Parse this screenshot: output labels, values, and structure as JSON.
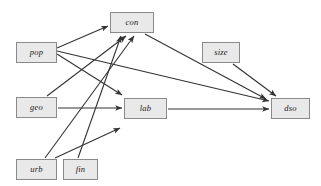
{
  "diagram": {
    "type": "directed-graph",
    "title": "",
    "canvas": {
      "width": 321,
      "height": 186,
      "background": "#ffffff"
    },
    "style": {
      "node_fill": "#e9e9e9",
      "node_border": "#8a8a8a",
      "edge_color": "#333333",
      "label_color": "#1a1a1a"
    },
    "nodes": [
      {
        "id": "con",
        "label": "con",
        "x": 110,
        "y": 12,
        "w": 44,
        "h": 21
      },
      {
        "id": "pop",
        "label": "pop",
        "x": 16,
        "y": 42,
        "w": 41,
        "h": 21
      },
      {
        "id": "size",
        "label": "size",
        "x": 202,
        "y": 42,
        "w": 38,
        "h": 21
      },
      {
        "id": "geo",
        "label": "geo",
        "x": 16,
        "y": 97,
        "w": 41,
        "h": 21
      },
      {
        "id": "lab",
        "label": "lab",
        "x": 124,
        "y": 98,
        "w": 43,
        "h": 21
      },
      {
        "id": "dso",
        "label": "dso",
        "x": 271,
        "y": 98,
        "w": 39,
        "h": 21
      },
      {
        "id": "urb",
        "label": "urb",
        "x": 16,
        "y": 159,
        "w": 41,
        "h": 21
      },
      {
        "id": "fin",
        "label": "fin",
        "x": 63,
        "y": 159,
        "w": 35,
        "h": 21
      }
    ],
    "edges": [
      {
        "from": "pop",
        "to": "con",
        "x1": 57,
        "y1": 48,
        "x2": 108,
        "y2": 26
      },
      {
        "from": "pop",
        "to": "lab",
        "x1": 57,
        "y1": 54,
        "x2": 122,
        "y2": 95
      },
      {
        "from": "pop",
        "to": "dso",
        "x1": 57,
        "y1": 51,
        "x2": 269,
        "y2": 101
      },
      {
        "from": "geo",
        "to": "con",
        "x1": 47,
        "y1": 96,
        "x2": 126,
        "y2": 36
      },
      {
        "from": "geo",
        "to": "lab",
        "x1": 58,
        "y1": 108,
        "x2": 122,
        "y2": 108
      },
      {
        "from": "urb",
        "to": "con",
        "x1": 45,
        "y1": 158,
        "x2": 134,
        "y2": 36
      },
      {
        "from": "urb",
        "to": "lab",
        "x1": 55,
        "y1": 158,
        "x2": 120,
        "y2": 128
      },
      {
        "from": "fin",
        "to": "con",
        "x1": 78,
        "y1": 158,
        "x2": 121,
        "y2": 36
      },
      {
        "from": "con",
        "to": "dso",
        "x1": 145,
        "y1": 34,
        "x2": 266,
        "y2": 99
      },
      {
        "from": "size",
        "to": "dso",
        "x1": 233,
        "y1": 64,
        "x2": 276,
        "y2": 96
      },
      {
        "from": "lab",
        "to": "dso",
        "x1": 168,
        "y1": 109,
        "x2": 269,
        "y2": 109
      }
    ]
  }
}
